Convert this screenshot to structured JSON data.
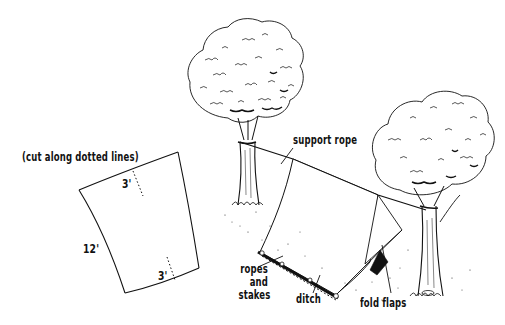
{
  "diagram": {
    "sheet_diagram": {
      "caption": "(cut along dotted lines)",
      "side_length": "12'",
      "cut_top": "3'",
      "cut_bottom": "3'"
    },
    "callouts": {
      "support_rope": "support rope",
      "ropes_and_stakes_line1": "ropes",
      "ropes_and_stakes_line2": "and",
      "ropes_and_stakes_line3": "stakes",
      "ditch": "ditch",
      "fold_flaps": "fold flaps"
    },
    "colors": {
      "ink": "#111111",
      "background": "#ffffff"
    }
  }
}
